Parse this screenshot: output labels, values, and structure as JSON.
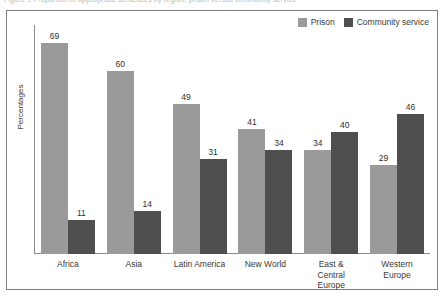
{
  "top_clip": {
    "text": "Figure 1   Proportion of appropriate sentences by region: prison versus community service"
  },
  "chart_data": {
    "type": "bar",
    "title": "",
    "subtitle": "",
    "xlabel": "",
    "ylabel": "Percentages",
    "ylim": [
      0,
      75
    ],
    "grid": false,
    "legend_position": "top-right",
    "categories": [
      "Africa",
      "Asia",
      "Latin America",
      "New World",
      "East & Central Europe",
      "Western Europe"
    ],
    "category_lines": [
      [
        "Africa"
      ],
      [
        "Asia"
      ],
      [
        "Latin America"
      ],
      [
        "New World"
      ],
      [
        "East &",
        "Central",
        "Europe"
      ],
      [
        "Western",
        "Europe"
      ]
    ],
    "series": [
      {
        "name": "Prison",
        "color": "#9a9a9a",
        "values": [
          69,
          60,
          49,
          41,
          34,
          29
        ]
      },
      {
        "name": "Community service",
        "color": "#4f4f4f",
        "values": [
          11,
          14,
          31,
          34,
          40,
          46
        ]
      }
    ]
  },
  "legend": {
    "entries": [
      {
        "label": "Prison",
        "color": "#9a9a9a"
      },
      {
        "label": "Community service",
        "color": "#4f4f4f"
      }
    ]
  },
  "colors": {
    "prison": "#9a9a9a",
    "community_service": "#4f4f4f",
    "frame": "#7e7e7e",
    "axis": "#8a8a8a",
    "text": "#3a3a3a",
    "background": "#ffffff"
  }
}
